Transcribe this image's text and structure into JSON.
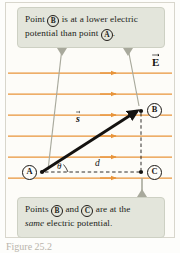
{
  "figure": {
    "type": "physics-diagram",
    "background_color": "#fdfcf8",
    "field_line_color": "#e8943a",
    "callout_fill": "#e3e5db",
    "callout_border": "#cdd0c3",
    "vector_color": "#141210",
    "leader_color": "#a8a99c"
  },
  "callout_top": {
    "line1_before": "Point ",
    "line1_point": "B",
    "line1_after": " is at a lower electric",
    "line2_before": "potential than point ",
    "line2_point": "A",
    "line2_after": "."
  },
  "callout_bottom": {
    "line1_before": "Points ",
    "line1_point_1": "B",
    "line1_mid": " and ",
    "line1_point_2": "C",
    "line1_after": " are at the",
    "line2_italic": "same",
    "line2_after": " electric potential."
  },
  "diagram": {
    "points": [
      {
        "id": "A",
        "label": "A",
        "x": 28,
        "y": 171
      },
      {
        "id": "B",
        "label": "B",
        "x": 153,
        "y": 109
      },
      {
        "id": "C",
        "label": "C",
        "x": 153,
        "y": 171
      }
    ],
    "labels": {
      "field_vector": "E",
      "displacement_vector": "s",
      "angle": "θ",
      "distance": "d"
    },
    "field_lines": {
      "count": 6,
      "y_positions": [
        73,
        94,
        115,
        136,
        157,
        178
      ],
      "x_start": 8,
      "x_end": 172,
      "arrow_x": 112,
      "direction": "left-to-right"
    },
    "displacement_vector": {
      "from": "A",
      "to": "B",
      "x1": 42,
      "y1": 172,
      "x2": 139,
      "y2": 110
    },
    "dashed_segments": [
      {
        "name": "horizontal-d",
        "from": "A",
        "to": "C",
        "x1": 45,
        "y1": 172,
        "x2": 143,
        "y2": 172
      },
      {
        "name": "vertical-BC",
        "from": "B",
        "to": "C",
        "x1": 142,
        "y1": 112,
        "x2": 142,
        "y2": 168
      }
    ],
    "leaders": [
      {
        "name": "leader-top-left",
        "x1": 62,
        "y1": 48,
        "x2": 48,
        "y2": 170
      },
      {
        "name": "leader-top-right",
        "x1": 128,
        "y1": 48,
        "x2": 139,
        "y2": 108
      },
      {
        "name": "leader-bottom",
        "x1": 142,
        "y1": 197,
        "x2": 142,
        "y2": 176
      }
    ]
  },
  "caption": {
    "text": "Figure 25.2"
  }
}
